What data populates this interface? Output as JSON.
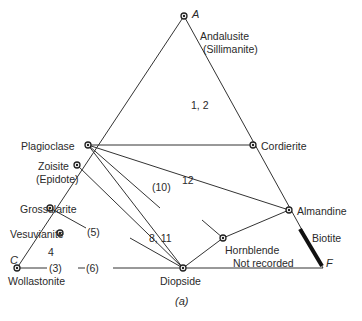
{
  "diagram": {
    "caption": "(a)",
    "vertices": {
      "A": {
        "label": "A",
        "x": 184,
        "y": 16
      },
      "C": {
        "label": "C",
        "x": 17,
        "y": 268
      },
      "F": {
        "label": "F",
        "x": 323,
        "y": 268
      }
    },
    "minerals": {
      "andalusite": "Andalusite",
      "sillimanite": "(Sillimanite)",
      "plagioclase": "Plagioclase",
      "cordierite": "Cordierite",
      "zoisite": "Zoisite",
      "epidote": "(Epidote)",
      "grossularite": "Grossularite",
      "vesuvianite": "Vesuvianite",
      "wollastonite": "Wollastonite",
      "diopside": "Diopside",
      "hornblende": "Hornblende",
      "almandine": "Almandine",
      "biotite": "Biotite"
    },
    "field_labels": {
      "f12": "1, 2",
      "f10": "(10)",
      "f12b": "12",
      "f5": "(5)",
      "f4": "4",
      "f811": "8, 11",
      "f3": "(3)",
      "f6": "(6)",
      "not_recorded": "Not recorded"
    }
  }
}
